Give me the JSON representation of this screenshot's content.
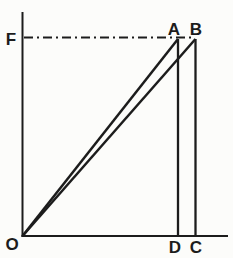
{
  "figure": {
    "background_color": "#fcfcfa",
    "line_color": "#1c1c1c",
    "labels": {
      "force_intercept": "F",
      "origin": "O",
      "apex_left": "A",
      "apex_right": "B",
      "base_left": "D",
      "base_right": "C"
    }
  }
}
